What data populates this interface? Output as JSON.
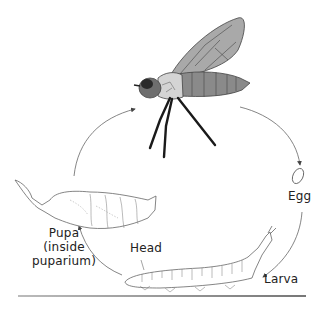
{
  "diagram": {
    "stages": [
      {
        "id": "adult",
        "label": ""
      },
      {
        "id": "egg",
        "label": "Egg"
      },
      {
        "id": "larva",
        "label": "Larva"
      },
      {
        "id": "pupa",
        "label_lines": [
          "Pupa",
          "(inside",
          "puparium)"
        ]
      }
    ],
    "annotations": {
      "head": "Head"
    },
    "colors": {
      "wing": "#a9a9a9",
      "abdomen": "#8a8a8a",
      "thorax": "#d4d4d4",
      "head": "#6e6e6e",
      "eye": "#2a2a2a",
      "legs": "#1a1a1a",
      "outline": "#444444",
      "arrow": "#555555"
    }
  }
}
